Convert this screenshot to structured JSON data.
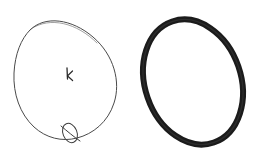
{
  "scene": {
    "width": 259,
    "height": 166,
    "background_color": "#ffffff",
    "description": "Two ring shapes side by side on a plain white background: a thin hand-drawn tilted ellipse with a small knot loop at its lower edge and a small pen mark at its center, and a thick solid black tilted O-ring."
  },
  "objects": [
    {
      "id": "sketched-ring",
      "label": "hand-drawn thin ellipse outline",
      "stroke_color": "#4a4a4a",
      "fill_color": "none",
      "stroke_width": 1,
      "center_x": 65,
      "center_y": 79,
      "radius_x": 52,
      "radius_y": 62,
      "rotation_deg": -28
    },
    {
      "id": "knot-loop",
      "label": "small loop knot at bottom of sketched ring",
      "stroke_color": "#3c3c3c",
      "fill_color": "none",
      "stroke_width": 1,
      "center_x": 70,
      "center_y": 133,
      "radius_x": 7,
      "radius_y": 10,
      "rotation_deg": -22
    },
    {
      "id": "center-mark",
      "label": "small hand-drawn k mark inside sketched ring",
      "glyph": "k",
      "stroke_color": "#2b2b2b",
      "center_x": 69,
      "center_y": 74
    },
    {
      "id": "rubber-ring",
      "label": "thick solid black O-ring",
      "stroke_color": "#1b1b1b",
      "fill_color": "none",
      "stroke_width": 6,
      "center_x": 193,
      "center_y": 82,
      "radius_x": 48,
      "radius_y": 64,
      "rotation_deg": -19
    }
  ]
}
